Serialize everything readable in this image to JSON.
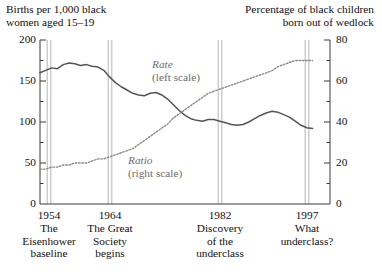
{
  "chart_data": {
    "type": "line",
    "title": "",
    "subtitle": "",
    "left_axis": {
      "label": "Births per 1,000 black\nwomen aged 15–19",
      "ticks": [
        0,
        50,
        100,
        150,
        200
      ],
      "tick_labels": [
        "0",
        "50",
        "100",
        "150",
        "200"
      ],
      "ylim": [
        0,
        200
      ],
      "minor_tick_step": 25
    },
    "right_axis": {
      "label": "Percentage of black children\nborn out of wedlock",
      "ticks": [
        0,
        20,
        40,
        60,
        80
      ],
      "tick_labels": [
        "0",
        "20",
        "40",
        "60",
        "80"
      ],
      "ylim": [
        0,
        80
      ],
      "minor_tick_step": 10
    },
    "xlim": [
      1950,
      2000
    ],
    "xlabel": "",
    "grid": false,
    "legend_position": "inline-annotation",
    "series": [
      {
        "name": "Rate",
        "annotation": "Rate",
        "annotation_sub": "(left scale)",
        "scale": "left",
        "style": "solid",
        "color": "#555555",
        "x": [
          1950,
          1951,
          1952,
          1953,
          1954,
          1955,
          1956,
          1957,
          1958,
          1959,
          1960,
          1961,
          1962,
          1963,
          1964,
          1965,
          1966,
          1967,
          1968,
          1969,
          1970,
          1971,
          1972,
          1973,
          1974,
          1975,
          1976,
          1977,
          1978,
          1979,
          1980,
          1981,
          1982,
          1983,
          1984,
          1985,
          1986,
          1987,
          1988,
          1989,
          1990,
          1991,
          1992,
          1993,
          1994,
          1995,
          1996,
          1997
        ],
        "values": [
          160,
          163,
          166,
          165,
          170,
          172,
          171,
          169,
          170,
          168,
          167,
          163,
          155,
          148,
          143,
          139,
          135,
          133,
          132,
          135,
          136,
          133,
          128,
          121,
          114,
          108,
          104,
          102,
          101,
          103,
          103,
          101,
          99,
          97,
          96,
          97,
          100,
          104,
          108,
          111,
          113,
          112,
          109,
          106,
          101,
          96,
          93,
          92
        ]
      },
      {
        "name": "Ratio",
        "annotation": "Ratio",
        "annotation_sub": "(right scale)",
        "scale": "right",
        "style": "dotted",
        "color": "#8a8a8a",
        "x": [
          1950,
          1951,
          1952,
          1953,
          1954,
          1955,
          1956,
          1957,
          1958,
          1959,
          1960,
          1961,
          1962,
          1963,
          1964,
          1965,
          1966,
          1967,
          1968,
          1969,
          1970,
          1971,
          1972,
          1973,
          1974,
          1975,
          1976,
          1977,
          1978,
          1979,
          1980,
          1981,
          1982,
          1983,
          1984,
          1985,
          1986,
          1987,
          1988,
          1989,
          1990,
          1991,
          1992,
          1993,
          1994,
          1995,
          1996,
          1997
        ],
        "values": [
          17,
          17,
          18,
          18,
          19,
          19,
          20,
          20,
          20,
          21,
          22,
          22,
          23,
          24,
          25,
          26,
          27,
          29,
          31,
          33,
          35,
          37,
          39,
          42,
          44,
          46,
          48,
          50,
          52,
          54,
          55,
          56,
          57,
          58,
          59,
          60,
          61,
          62,
          63,
          64,
          65,
          67,
          68,
          69,
          70,
          70,
          70,
          70
        ]
      }
    ],
    "events": [
      {
        "year": 1954,
        "year_label": "1954",
        "caption": "The\nEisenhower\nbaseline",
        "x_px": 49
      },
      {
        "year": 1964,
        "year_label": "1964",
        "caption": "The Great\nSociety\nbegins",
        "x_px": 110
      },
      {
        "year": 1982,
        "year_label": "1982",
        "caption": "Discovery\nof the\nunderclass",
        "x_px": 220
      },
      {
        "year": 1997,
        "year_label": "1997",
        "caption": "What\nunderclass?",
        "x_px": 307
      }
    ],
    "colors": {
      "axis": "#3a3a3a",
      "rate_line": "#555555",
      "ratio_line": "#8a8a8a",
      "event_line": "#b5b5b5",
      "text": "#111111"
    }
  }
}
